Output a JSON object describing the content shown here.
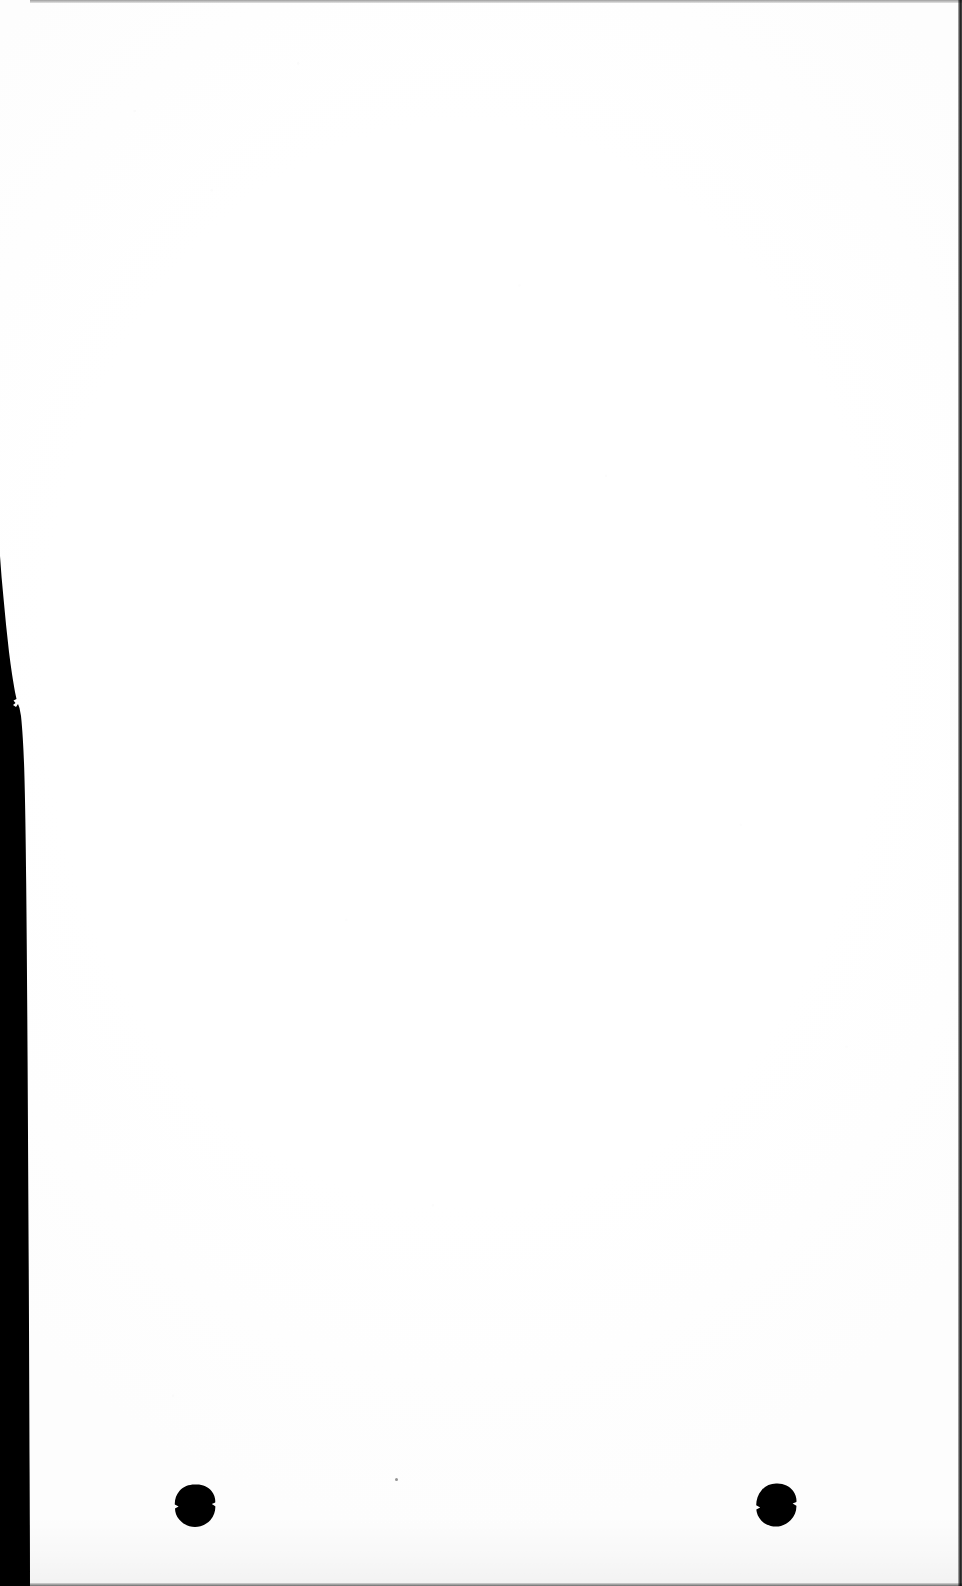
{
  "page": {
    "kind": "scanned-document-page",
    "width": 962,
    "height": 1586,
    "orientation": "portrait",
    "body_text": "",
    "content_note": "blank page",
    "paper_color": "#ffffff",
    "ink_color": "#000000"
  },
  "artifacts": {
    "edge_shadow_left": {
      "name": "left-edge-scanner-shadow",
      "color": "#000000",
      "starts_y": 555,
      "ends_y": 1586,
      "max_width": 32
    },
    "edge_rule_right": {
      "name": "right-edge-rule",
      "color": "#000000",
      "width": 4
    },
    "edge_rule_top": {
      "name": "top-edge-rule",
      "color": "#3a3a3a",
      "height": 3
    },
    "edge_rule_bottom": {
      "name": "bottom-edge-rule",
      "color": "#2b2b2b",
      "height": 3
    },
    "ink_blots": [
      {
        "name": "ink-blot-left",
        "x": 173,
        "y": 1484,
        "width": 43,
        "height": 44,
        "color": "#000000"
      },
      {
        "name": "ink-blot-right",
        "x": 753,
        "y": 1483,
        "width": 45,
        "height": 45,
        "color": "#000000"
      }
    ],
    "specks": [
      {
        "name": "speck-center-low",
        "x": 395,
        "y": 1478,
        "size": 3,
        "color": "#6a6a6a"
      }
    ]
  }
}
